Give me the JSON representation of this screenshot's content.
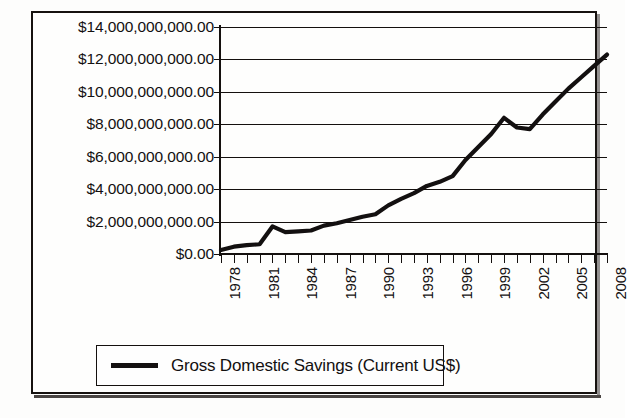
{
  "chart_data": {
    "type": "line",
    "title": "",
    "xlabel": "",
    "ylabel": "",
    "ylim": [
      0,
      14000000000000
    ],
    "ytick_values": [
      0,
      2000000000000,
      4000000000000,
      6000000000000,
      8000000000000,
      10000000000000,
      12000000000000,
      14000000000000
    ],
    "ytick_labels": [
      "$14,000,000,000.00",
      "$12,000,000,000.00",
      "$10,000,000,000.00",
      "$8,000,000,000.00",
      "$6,000,000,000.00",
      "$4,000,000,000.00",
      "$2,000,000,000.00",
      "$0.00"
    ],
    "xlim": [
      1978,
      2008
    ],
    "xtick_labels": [
      "1978",
      "1981",
      "1984",
      "1987",
      "1990",
      "1993",
      "1996",
      "1999",
      "2002",
      "2005",
      "2008"
    ],
    "xtick_interval": 3,
    "x_minor_ticks_every_year": true,
    "grid": "horizontal",
    "legend_position": "bottom",
    "line_color": "#131010",
    "series": [
      {
        "name": "Gross Domestic Savings (Current US$)",
        "x": [
          1978,
          1979,
          1980,
          1981,
          1982,
          1983,
          1984,
          1985,
          1986,
          1987,
          1988,
          1989,
          1990,
          1991,
          1992,
          1993,
          1994,
          1995,
          1996,
          1997,
          1998,
          1999,
          2000,
          2001,
          2002,
          2003,
          2004,
          2005,
          2006,
          2007,
          2008
        ],
        "values": [
          0.25,
          0.45,
          0.55,
          0.6,
          1.7,
          1.35,
          1.4,
          1.45,
          1.75,
          1.9,
          2.1,
          2.3,
          2.45,
          3.0,
          3.4,
          3.75,
          4.2,
          4.45,
          4.8,
          5.8,
          6.6,
          7.4,
          8.4,
          7.8,
          7.7,
          8.6,
          9.4,
          10.2,
          10.9,
          11.6,
          12.3
        ],
        "value_units": "trillions of current US$"
      }
    ]
  },
  "legend": {
    "label": "Gross Domestic Savings (Current US$)"
  },
  "scan_artifacts": {
    "ghost_text_1": "",
    "ghost_text_2": "",
    "ghost_text_3": ""
  }
}
